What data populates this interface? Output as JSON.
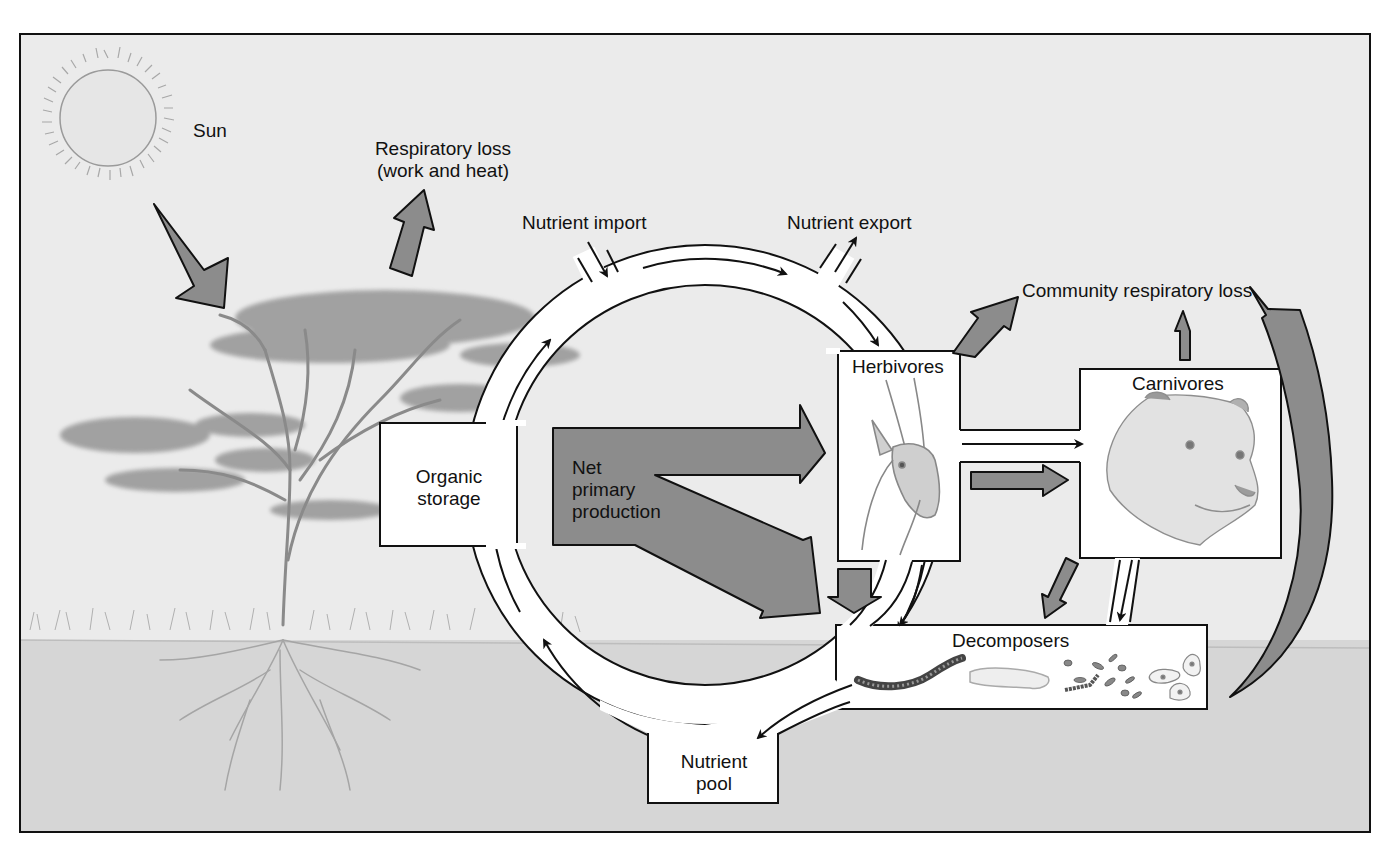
{
  "figure": {
    "colors": {
      "sky": "#ebebeb",
      "ground": "#d6d6d6",
      "arrow_fill": "#8c8c8c",
      "stroke": "#111111",
      "box_fill": "#ffffff",
      "frame": "#111111"
    }
  },
  "labels": {
    "sun": "Sun",
    "respiratory_loss": "Respiratory loss\n(work and heat)",
    "nutrient_import": "Nutrient import",
    "nutrient_export": "Nutrient export",
    "community_respiratory_loss": "Community respiratory loss",
    "herbivores": "Herbivores",
    "carnivores": "Carnivores",
    "organic_storage": "Organic\nstorage",
    "net_primary_production": "Net\nprimary\nproduction",
    "decomposers": "Decomposers",
    "nutrient_pool": "Nutrient\npool"
  },
  "illustrations": {
    "sun": "sun-icon",
    "tree": "acacia-tree",
    "herbivore": "gazelle-head",
    "carnivore": "lioness-head",
    "decomposers": [
      "millipede",
      "grub",
      "bacteria",
      "protozoa"
    ]
  }
}
